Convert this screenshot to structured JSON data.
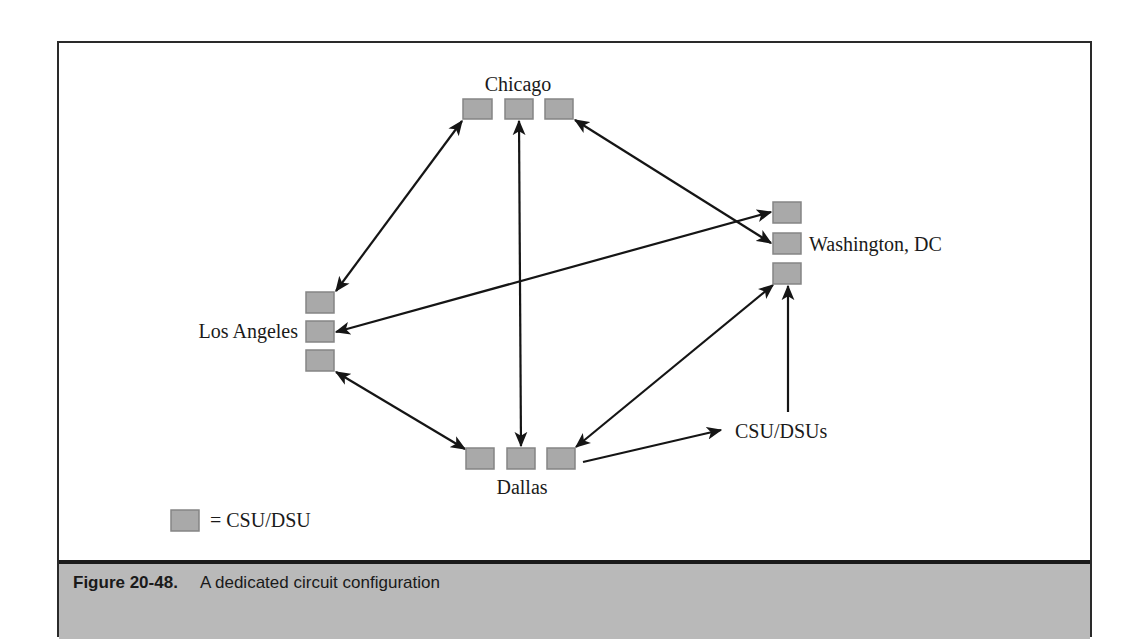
{
  "figure": {
    "number": "Figure 20-48.",
    "caption": "A dedicated circuit configuration"
  },
  "sites": {
    "chicago": {
      "label": "Chicago",
      "devices": 3
    },
    "washington": {
      "label": "Washington, DC",
      "devices": 3
    },
    "los_angeles": {
      "label": "Los Angeles",
      "devices": 3
    },
    "dallas": {
      "label": "Dallas",
      "devices": 3
    }
  },
  "annotations": {
    "csu_dsus_label": "CSU/DSUs"
  },
  "legend": {
    "symbol": "gray-box",
    "text": "= CSU/DSU"
  },
  "links": [
    {
      "from": "Los Angeles (top)",
      "to": "Chicago (left)",
      "type": "bidirectional"
    },
    {
      "from": "Chicago (middle)",
      "to": "Dallas (middle)",
      "type": "bidirectional"
    },
    {
      "from": "Chicago (right)",
      "to": "Washington, DC (middle)",
      "type": "bidirectional"
    },
    {
      "from": "Los Angeles (middle)",
      "to": "Washington, DC (top)",
      "type": "bidirectional"
    },
    {
      "from": "Los Angeles (bottom)",
      "to": "Dallas (left)",
      "type": "bidirectional"
    },
    {
      "from": "Dallas (right)",
      "to": "Washington, DC (bottom)",
      "type": "bidirectional"
    }
  ],
  "colors": {
    "device_fill": "#a9a9a9",
    "caption_bar": "#b9b9b9",
    "line": "#151515"
  }
}
